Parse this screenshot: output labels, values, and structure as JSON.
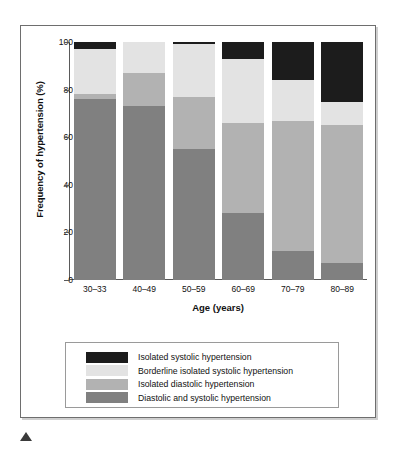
{
  "chart_data": {
    "type": "bar",
    "subtype": "stacked-bar-100",
    "title": "",
    "xlabel": "Age (years)",
    "ylabel": "Frequency of hypertension (%)",
    "ylim": [
      0,
      100
    ],
    "yticks": [
      0,
      20,
      40,
      60,
      80,
      100
    ],
    "ytick_labels": [
      "0",
      "20",
      "40",
      "60",
      "80",
      "100"
    ],
    "grid": false,
    "legend_position": "below-plot",
    "categories": [
      "30–33",
      "40–49",
      "50–59",
      "60–69",
      "70–79",
      "80–89"
    ],
    "series": [
      {
        "name": "Diastolic and systolic hypertension",
        "color": "#808080",
        "values": [
          76,
          73,
          55,
          28,
          12,
          7
        ]
      },
      {
        "name": "Isolated diastolic hypertension",
        "color": "#b2b2b2",
        "values": [
          2,
          14,
          22,
          38,
          55,
          58
        ]
      },
      {
        "name": "Borderline isolated systolic hypertension",
        "color": "#e3e3e3",
        "values": [
          19,
          13,
          22,
          27,
          17,
          10
        ]
      },
      {
        "name": "Isolated systolic hypertension",
        "color": "#1c1c1c",
        "values": [
          3,
          0,
          1,
          7,
          16,
          25
        ]
      }
    ],
    "stack_order_bottom_to_top": [
      "Diastolic and systolic hypertension",
      "Isolated diastolic hypertension",
      "Borderline isolated systolic hypertension",
      "Isolated systolic hypertension"
    ]
  },
  "legend": {
    "entries": [
      {
        "label": "Isolated systolic hypertension",
        "color": "#1c1c1c"
      },
      {
        "label": "Borderline isolated systolic hypertension",
        "color": "#e3e3e3"
      },
      {
        "label": "Isolated diastolic hypertension",
        "color": "#b2b2b2"
      },
      {
        "label": "Diastolic and systolic hypertension",
        "color": "#808080"
      }
    ]
  },
  "colors": {
    "isolated_systolic": "#1c1c1c",
    "borderline_isolated_systolic": "#e3e3e3",
    "isolated_diastolic": "#b2b2b2",
    "diastolic_and_systolic": "#808080",
    "axis": "#5a5a5a",
    "frame": "#6e6e6e",
    "text": "#111111",
    "background": "#ffffff"
  }
}
